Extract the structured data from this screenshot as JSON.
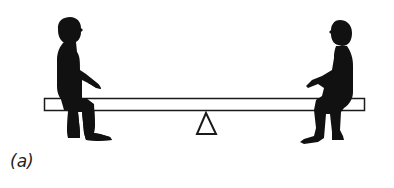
{
  "figure": {
    "caption": "(a)",
    "colors": {
      "silhouette": "#111111",
      "outline": "#1a1a1a",
      "beam_fill": "#ffffff",
      "background": "#ffffff"
    },
    "elements": {
      "beam": {
        "label": "seesaw-beam"
      },
      "fulcrum": {
        "label": "triangle-fulcrum"
      },
      "left_person": {
        "label": "seated-person-left",
        "facing": "right"
      },
      "right_person": {
        "label": "seated-person-right",
        "facing": "left"
      }
    }
  }
}
